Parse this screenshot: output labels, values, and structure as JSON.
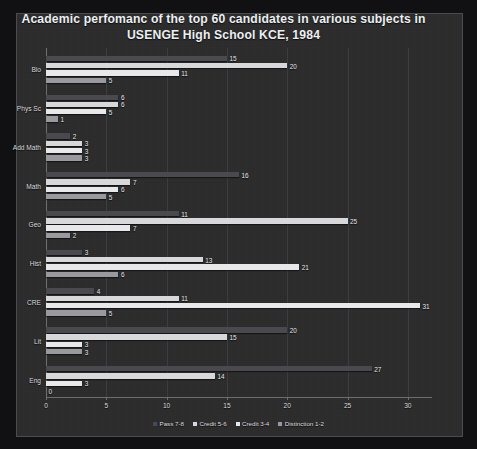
{
  "chart_data": {
    "type": "bar",
    "orientation": "horizontal",
    "title": "Academic perfomanc of the top 60 candidates in various subjects in USENGE High School KCE, 1984",
    "title_line1": "Academic perfomanc of the top 60 candidates in various subjects in",
    "title_line2": "USENGE High School KCE, 1984",
    "xlabel": "",
    "ylabel": "",
    "xlim": [
      0,
      32
    ],
    "xticks": [
      0,
      5,
      10,
      15,
      20,
      25,
      30
    ],
    "xtick_labels": [
      "0",
      "5",
      "10",
      "15",
      "20",
      "25",
      "30"
    ],
    "grid": true,
    "legend_position": "bottom",
    "categories": [
      "Bio",
      "Phys Sc",
      "Add Math",
      "Math",
      "Geo",
      "Hist",
      "CRE",
      "Lit",
      "Eng"
    ],
    "series": [
      {
        "name": "Pass 7-8",
        "color": "#4a4a4e",
        "values": [
          15,
          6,
          2,
          16,
          11,
          3,
          4,
          20,
          27
        ]
      },
      {
        "name": "Credit 5-6",
        "color": "#d8d8da",
        "values": [
          20,
          6,
          3,
          7,
          25,
          13,
          11,
          15,
          14
        ]
      },
      {
        "name": "Credit 3-4",
        "color": "#e8e8ea",
        "values": [
          11,
          5,
          3,
          6,
          7,
          21,
          31,
          3,
          3
        ]
      },
      {
        "name": "Distinction 1-2",
        "color": "#9a9a9e",
        "values": [
          5,
          1,
          3,
          5,
          2,
          6,
          5,
          3,
          0
        ]
      }
    ]
  },
  "legend": {
    "items": [
      {
        "label": "Pass 7-8",
        "color": "#4a4a4e"
      },
      {
        "label": "Credit 5-6",
        "color": "#d8d8da"
      },
      {
        "label": "Credit 3-4",
        "color": "#e8e8ea"
      },
      {
        "label": "Distinction 1-2",
        "color": "#9a9a9e"
      }
    ]
  },
  "style": {
    "page_background": "#111113",
    "plot_background": "#2a2a2c",
    "frame_border": "#4c4c50",
    "axis_color": "#6d6d72",
    "grid_color": "#3d3d41",
    "text_color": "#e8e8ea"
  }
}
